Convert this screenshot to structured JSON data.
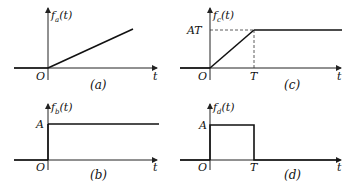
{
  "panels": {
    "a": {
      "ylabel_main": "f",
      "ylabel_sub": "a",
      "ylabel_arg": "(t)",
      "origin": "O",
      "xlabel": "t",
      "caption": "(a)",
      "type": "ramp"
    },
    "b": {
      "ylabel_main": "f",
      "ylabel_sub": "b",
      "ylabel_arg": "(t)",
      "origin": "O",
      "xlabel": "t",
      "caption": "(b)",
      "level": "A",
      "type": "step"
    },
    "c": {
      "ylabel_main": "f",
      "ylabel_sub": "c",
      "ylabel_arg": "(t)",
      "origin": "O",
      "xlabel": "t",
      "caption": "(c)",
      "level": "AT",
      "tmark": "T",
      "type": "saturated-ramp"
    },
    "d": {
      "ylabel_main": "f",
      "ylabel_sub": "d",
      "ylabel_arg": "(t)",
      "origin": "O",
      "xlabel": "t",
      "caption": "(d)",
      "level": "A",
      "tmark": "T",
      "type": "rectangular-pulse"
    }
  }
}
